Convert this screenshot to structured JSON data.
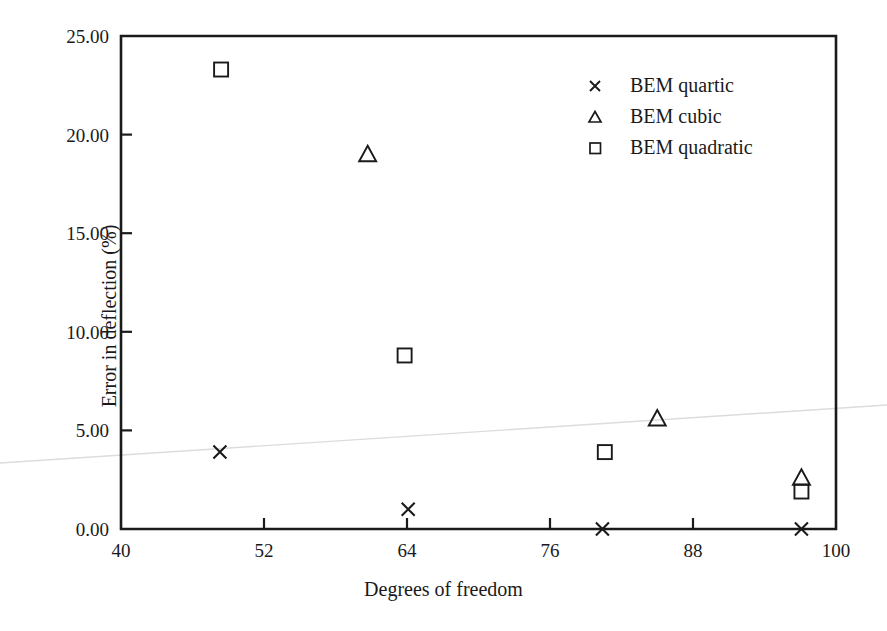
{
  "chart_data": {
    "type": "scatter",
    "title": "",
    "xlabel": "Degrees of freedom",
    "ylabel": "Error in deflection (%)",
    "xlim": [
      40,
      100
    ],
    "ylim": [
      0,
      25
    ],
    "xticks": [
      "40",
      "52",
      "64",
      "76",
      "88",
      "100"
    ],
    "xtick_values": [
      40,
      52,
      64,
      76,
      88,
      100
    ],
    "yticks": [
      "0.00",
      "5.00",
      "10.00",
      "15.00",
      "20.00",
      "25.00"
    ],
    "ytick_values": [
      0,
      5,
      10,
      15,
      20,
      25
    ],
    "grid": false,
    "legend_position": "upper-right-inside",
    "series": [
      {
        "name": "BEM quartic",
        "marker": "cross",
        "points": [
          {
            "x": 48.3,
            "y": 3.9
          },
          {
            "x": 64.1,
            "y": 1.0
          },
          {
            "x": 80.4,
            "y": 0.0
          },
          {
            "x": 97.1,
            "y": 0.0
          }
        ]
      },
      {
        "name": "BEM cubic",
        "marker": "triangle",
        "points": [
          {
            "x": 60.7,
            "y": 19.0
          },
          {
            "x": 85.0,
            "y": 5.6
          },
          {
            "x": 97.1,
            "y": 2.6
          }
        ]
      },
      {
        "name": "BEM quadratic",
        "marker": "square",
        "points": [
          {
            "x": 48.4,
            "y": 23.3
          },
          {
            "x": 63.8,
            "y": 8.8
          },
          {
            "x": 80.6,
            "y": 3.9
          },
          {
            "x": 97.1,
            "y": 1.9
          }
        ]
      }
    ]
  },
  "legend": {
    "items": [
      {
        "marker": "cross-marker",
        "label": "BEM quartic"
      },
      {
        "marker": "triangle-marker",
        "label": "BEM cubic"
      },
      {
        "marker": "square-marker",
        "label": "BEM quadratic"
      }
    ]
  },
  "colors": {
    "axis": "#1a1a1a",
    "marker": "#1a1a1a",
    "background": "#ffffff",
    "artifact_line": "#dcdcdc"
  }
}
